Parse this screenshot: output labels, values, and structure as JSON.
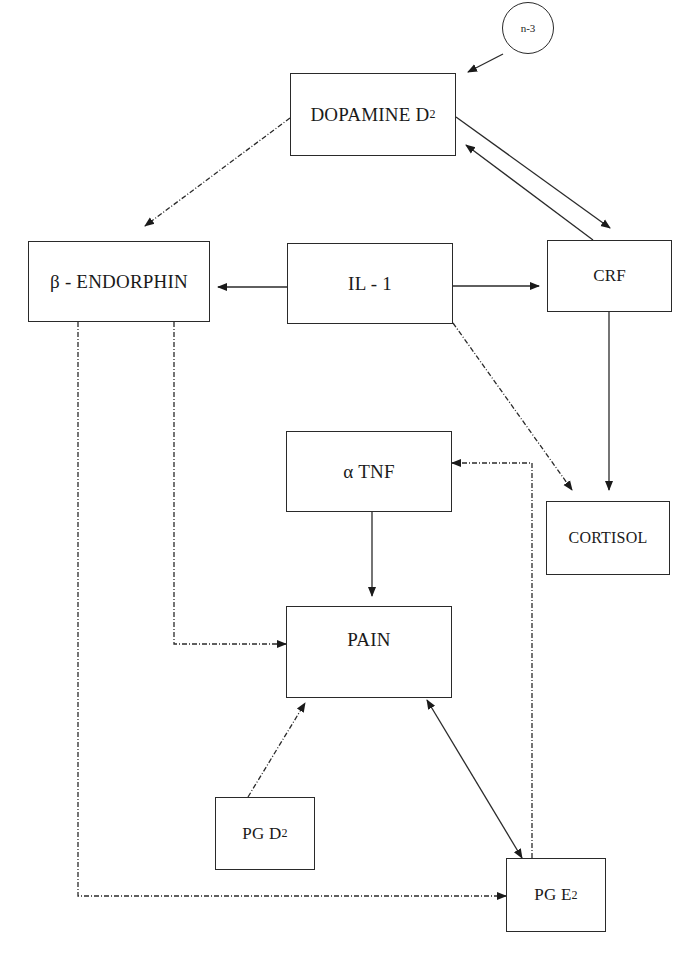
{
  "diagram": {
    "nodes": {
      "n3": {
        "label": "n-3"
      },
      "dopamine": {
        "label": "DOPAMINE D",
        "sub": "2"
      },
      "endorphin": {
        "label": "β - ENDORPHIN"
      },
      "il1": {
        "label": "IL - 1"
      },
      "crf": {
        "label": "CRF"
      },
      "tnf": {
        "label": "α TNF"
      },
      "cortisol": {
        "label": "CORTISOL"
      },
      "pain": {
        "label": "PAIN"
      },
      "pgd2": {
        "label": "PG D",
        "sub": "2"
      },
      "pge2": {
        "label": "PG E",
        "sub": "2"
      }
    },
    "edges": [
      {
        "from": "n-3",
        "to": "DOPAMINE D2",
        "style": "solid"
      },
      {
        "from": "DOPAMINE D2",
        "to": "CRF",
        "style": "solid"
      },
      {
        "from": "CRF",
        "to": "DOPAMINE D2",
        "style": "solid"
      },
      {
        "from": "DOPAMINE D2",
        "to": "β - ENDORPHIN",
        "style": "dash-dot"
      },
      {
        "from": "IL - 1",
        "to": "β - ENDORPHIN",
        "style": "solid"
      },
      {
        "from": "IL - 1",
        "to": "CRF",
        "style": "solid"
      },
      {
        "from": "IL - 1",
        "to": "CORTISOL",
        "style": "dash-dot"
      },
      {
        "from": "CRF",
        "to": "CORTISOL",
        "style": "solid"
      },
      {
        "from": "α TNF",
        "to": "PAIN",
        "style": "solid"
      },
      {
        "from": "β - ENDORPHIN",
        "to": "PAIN",
        "style": "dash-dot"
      },
      {
        "from": "β - ENDORPHIN",
        "to": "PG E2",
        "style": "dash-dot"
      },
      {
        "from": "PG D2",
        "to": "PAIN",
        "style": "dash-dot"
      },
      {
        "from": "PAIN",
        "to": "PG E2",
        "style": "solid",
        "bidirectional": true
      },
      {
        "from": "PG E2",
        "to": "α TNF",
        "style": "dash-dot"
      }
    ]
  }
}
